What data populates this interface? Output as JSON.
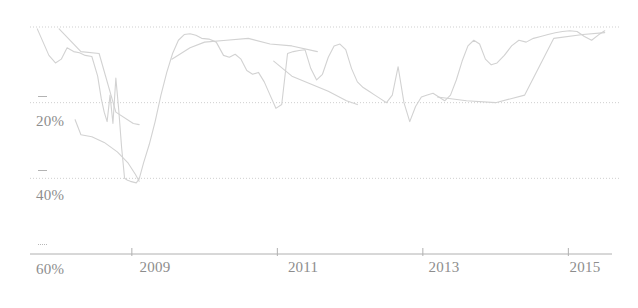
{
  "chart_data": {
    "type": "line",
    "title": "",
    "subtitle": "",
    "xlabel": "",
    "ylabel": "",
    "xlim": [
      2007.6,
      2015.6
    ],
    "ylim": [
      60,
      0
    ],
    "y_inverted": true,
    "grid": true,
    "legend": null,
    "legend_position": "none",
    "line_color": "#d2d2d2",
    "grid_color": "#cfcfcf",
    "axis_color": "#b0b0b0",
    "label_color": "#8d8d8d",
    "background_color": "#ffffff",
    "y_ticks": [
      {
        "value": 0,
        "label": ""
      },
      {
        "value": 20,
        "label": "20%"
      },
      {
        "value": 40,
        "label": "40%"
      },
      {
        "value": 60,
        "label": "60%"
      }
    ],
    "x_ticks": [
      {
        "value": 2009,
        "label": "2009"
      },
      {
        "value": 2011,
        "label": "2011"
      },
      {
        "value": 2013,
        "label": "2013"
      },
      {
        "value": 2015,
        "label": "2015"
      }
    ],
    "series": [
      {
        "name": "drawdown",
        "x": [
          2007.7,
          2007.78,
          2007.86,
          2007.95,
          2008.03,
          2008.11,
          2008.2,
          2008.28,
          2008.36,
          2008.45,
          2008.53,
          2008.58,
          2008.62,
          2008.66,
          2008.7,
          2008.74,
          2008.78,
          2008.82,
          2008.86,
          2008.9,
          2008.94,
          2008.98,
          2009.02,
          2009.06,
          2009.1,
          2009.16,
          2009.24,
          2009.32,
          2009.4,
          2009.48,
          2009.56,
          2009.64,
          2009.72,
          2009.8,
          2009.88,
          2009.96,
          2010.06,
          2010.16,
          2010.26,
          2010.34,
          2010.42,
          2010.5,
          2010.58,
          2010.66,
          2010.74,
          2010.82,
          2010.9,
          2010.98,
          2011.06,
          2011.14,
          2011.22,
          2011.3,
          2011.38,
          2011.46,
          2011.54,
          2011.62,
          2011.7,
          2011.78,
          2011.86,
          2011.94,
          2012.02,
          2012.1,
          2012.18,
          2012.26,
          2012.34,
          2012.42,
          2012.5,
          2012.58,
          2012.66,
          2012.74,
          2012.82,
          2012.9,
          2012.98,
          2013.06,
          2013.14,
          2013.22,
          2013.3,
          2013.38,
          2013.46,
          2013.54,
          2013.62,
          2013.7,
          2013.78,
          2013.86,
          2013.94,
          2014.02,
          2014.12,
          2014.22,
          2014.32,
          2014.42,
          2014.52,
          2014.62,
          2014.72,
          2014.82,
          2014.92,
          2015.02,
          2015.12,
          2015.22,
          2015.32,
          2015.42,
          2015.5
        ],
        "y": [
          0.5,
          4.0,
          7.5,
          9.5,
          8.5,
          5.5,
          6.5,
          6.8,
          7.5,
          7.8,
          13.0,
          19.0,
          22.5,
          25.0,
          18.0,
          25.5,
          13.5,
          22.0,
          32.0,
          40.0,
          40.5,
          40.8,
          41.0,
          41.2,
          40.2,
          36.0,
          31.0,
          25.0,
          18.0,
          12.0,
          7.0,
          3.5,
          2.0,
          1.8,
          2.2,
          3.0,
          3.2,
          4.0,
          7.5,
          8.0,
          7.2,
          8.5,
          11.5,
          12.5,
          12.0,
          14.5,
          18.0,
          21.5,
          20.5,
          7.0,
          6.5,
          6.2,
          6.0,
          11.0,
          14.0,
          12.5,
          8.0,
          5.0,
          4.5,
          6.0,
          11.0,
          14.5,
          16.0,
          17.0,
          18.0,
          19.0,
          20.0,
          18.0,
          10.5,
          20.0,
          25.0,
          21.0,
          18.5,
          18.0,
          17.5,
          18.5,
          19.5,
          18.0,
          14.0,
          9.0,
          5.0,
          3.5,
          4.5,
          8.5,
          10.0,
          9.5,
          7.5,
          5.0,
          3.5,
          4.0,
          3.0,
          2.5,
          2.0,
          1.5,
          1.2,
          1.0,
          1.2,
          2.5,
          3.5,
          2.0,
          1.0
        ]
      },
      {
        "name": "overlay-low-arc",
        "x": [
          2008.22,
          2008.3,
          2008.45,
          2008.62,
          2008.8,
          2008.95,
          2009.05,
          2009.1
        ],
        "y": [
          24.5,
          28.5,
          29.0,
          30.5,
          33.0,
          36.0,
          39.0,
          40.8
        ]
      },
      {
        "name": "overlay-upper-left",
        "x": [
          2008.0,
          2008.3,
          2008.55,
          2008.78,
          2009.02,
          2009.1
        ],
        "y": [
          0.5,
          6.5,
          7.0,
          22.5,
          25.5,
          25.8
        ]
      },
      {
        "name": "overlay-mid-rise",
        "x": [
          2009.55,
          2009.8,
          2010.0,
          2010.3,
          2010.6,
          2010.9,
          2011.2,
          2011.55
        ],
        "y": [
          8.5,
          5.5,
          4.0,
          3.5,
          3.0,
          4.5,
          5.0,
          6.5
        ]
      },
      {
        "name": "overlay-decline-2011",
        "x": [
          2010.95,
          2011.2,
          2011.45,
          2011.7,
          2011.95,
          2012.1
        ],
        "y": [
          9.0,
          13.0,
          15.0,
          17.0,
          19.5,
          20.5
        ]
      },
      {
        "name": "overlay-right-plateau",
        "x": [
          2013.2,
          2013.6,
          2014.0,
          2014.4,
          2014.8,
          2015.2,
          2015.5
        ],
        "y": [
          18.5,
          19.5,
          20.0,
          18.0,
          3.0,
          2.0,
          1.5
        ]
      }
    ]
  }
}
